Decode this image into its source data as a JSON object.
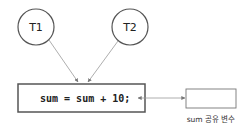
{
  "diagram": {
    "threads": [
      {
        "id": "t1",
        "label": "T1"
      },
      {
        "id": "t2",
        "label": "T2"
      }
    ],
    "code_box": {
      "text": "sum = sum + 10;"
    },
    "shared_variable": {
      "label": "sum 공유 변수"
    },
    "colors": {
      "stroke": "#555555",
      "arrow": "#888888",
      "text": "#222222"
    }
  }
}
